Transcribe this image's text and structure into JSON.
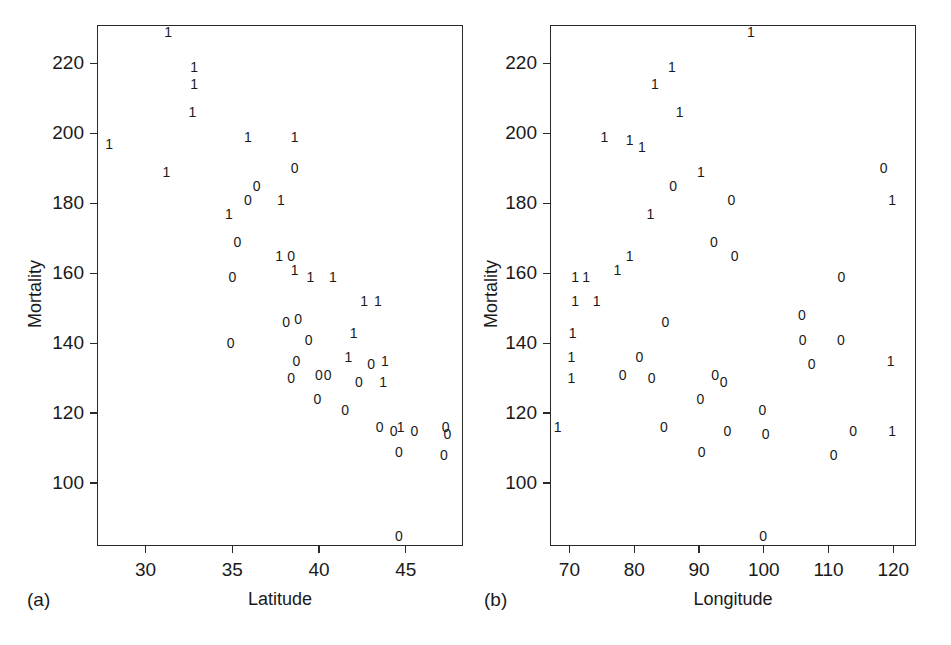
{
  "figure": {
    "background": "#ffffff",
    "ink": "#1a1a1a"
  },
  "chart_data": [
    {
      "type": "scatter",
      "panel_tag": "(a)",
      "title": "",
      "xlabel": "Latitude",
      "ylabel": "Mortality",
      "xlim": [
        27.2,
        48.3
      ],
      "ylim": [
        82,
        231
      ],
      "xticks": [
        30,
        35,
        40,
        45
      ],
      "xticklabels": [
        "30",
        "35",
        "40",
        "45"
      ],
      "yticks": [
        100,
        120,
        140,
        160,
        180,
        200,
        220
      ],
      "yticklabels": [
        "100",
        "120",
        "140",
        "160",
        "180",
        "200",
        "220"
      ],
      "grid": false,
      "legend": "none",
      "marker_encoding": "group label digit: 1 or 0",
      "groups": [
        "1",
        "0"
      ],
      "points": [
        {
          "x": 31.3,
          "y": 229,
          "label": "1"
        },
        {
          "x": 32.8,
          "y": 219,
          "label": "1"
        },
        {
          "x": 32.8,
          "y": 214,
          "label": "1"
        },
        {
          "x": 32.7,
          "y": 206,
          "label": "1"
        },
        {
          "x": 27.9,
          "y": 197,
          "label": "1"
        },
        {
          "x": 31.2,
          "y": 189,
          "label": "1"
        },
        {
          "x": 35.9,
          "y": 199,
          "label": "1"
        },
        {
          "x": 38.6,
          "y": 199,
          "label": "1"
        },
        {
          "x": 38.6,
          "y": 190,
          "label": "0"
        },
        {
          "x": 36.4,
          "y": 185,
          "label": "0"
        },
        {
          "x": 35.9,
          "y": 181,
          "label": "0"
        },
        {
          "x": 37.8,
          "y": 181,
          "label": "1"
        },
        {
          "x": 34.8,
          "y": 177,
          "label": "1"
        },
        {
          "x": 35.3,
          "y": 169,
          "label": "0"
        },
        {
          "x": 37.7,
          "y": 165,
          "label": "1"
        },
        {
          "x": 38.4,
          "y": 165,
          "label": "0"
        },
        {
          "x": 38.6,
          "y": 161,
          "label": "1"
        },
        {
          "x": 35.0,
          "y": 159,
          "label": "0"
        },
        {
          "x": 39.5,
          "y": 159,
          "label": "1"
        },
        {
          "x": 40.8,
          "y": 159,
          "label": "1"
        },
        {
          "x": 42.6,
          "y": 152,
          "label": "1"
        },
        {
          "x": 43.4,
          "y": 152,
          "label": "1"
        },
        {
          "x": 38.8,
          "y": 147,
          "label": "0"
        },
        {
          "x": 38.1,
          "y": 146,
          "label": "0"
        },
        {
          "x": 34.9,
          "y": 140,
          "label": "0"
        },
        {
          "x": 39.4,
          "y": 141,
          "label": "0"
        },
        {
          "x": 42.0,
          "y": 143,
          "label": "1"
        },
        {
          "x": 38.7,
          "y": 135,
          "label": "0"
        },
        {
          "x": 41.7,
          "y": 136,
          "label": "1"
        },
        {
          "x": 43.0,
          "y": 134,
          "label": "0"
        },
        {
          "x": 43.8,
          "y": 135,
          "label": "1"
        },
        {
          "x": 38.4,
          "y": 130,
          "label": "0"
        },
        {
          "x": 40.0,
          "y": 131,
          "label": "0"
        },
        {
          "x": 40.5,
          "y": 131,
          "label": "0"
        },
        {
          "x": 42.3,
          "y": 129,
          "label": "0"
        },
        {
          "x": 43.7,
          "y": 129,
          "label": "1"
        },
        {
          "x": 39.9,
          "y": 124,
          "label": "0"
        },
        {
          "x": 41.5,
          "y": 121,
          "label": "0"
        },
        {
          "x": 43.5,
          "y": 116,
          "label": "0"
        },
        {
          "x": 44.3,
          "y": 115,
          "label": "0"
        },
        {
          "x": 44.7,
          "y": 116,
          "label": "1"
        },
        {
          "x": 45.5,
          "y": 115,
          "label": "0"
        },
        {
          "x": 47.3,
          "y": 116,
          "label": "0"
        },
        {
          "x": 47.4,
          "y": 114,
          "label": "0"
        },
        {
          "x": 44.6,
          "y": 109,
          "label": "0"
        },
        {
          "x": 47.2,
          "y": 108,
          "label": "0"
        },
        {
          "x": 44.6,
          "y": 85,
          "label": "0"
        }
      ]
    },
    {
      "type": "scatter",
      "panel_tag": "(b)",
      "title": "",
      "xlabel": "Longitude",
      "ylabel": "Mortality",
      "xlim": [
        67.0,
        123.5
      ],
      "ylim": [
        82,
        231
      ],
      "xticks": [
        70,
        80,
        90,
        100,
        110,
        120
      ],
      "xticklabels": [
        "70",
        "80",
        "90",
        "100",
        "110",
        "120"
      ],
      "yticks": [
        100,
        120,
        140,
        160,
        180,
        200,
        220
      ],
      "yticklabels": [
        "100",
        "120",
        "140",
        "160",
        "180",
        "200",
        "220"
      ],
      "grid": false,
      "legend": "none",
      "marker_encoding": "group label digit: 1 or 0",
      "groups": [
        "1",
        "0"
      ],
      "points": [
        {
          "x": 98.0,
          "y": 229,
          "label": "1"
        },
        {
          "x": 85.8,
          "y": 219,
          "label": "1"
        },
        {
          "x": 83.2,
          "y": 214,
          "label": "1"
        },
        {
          "x": 87.0,
          "y": 206,
          "label": "1"
        },
        {
          "x": 75.4,
          "y": 199,
          "label": "1"
        },
        {
          "x": 79.3,
          "y": 198,
          "label": "1"
        },
        {
          "x": 81.2,
          "y": 196,
          "label": "1"
        },
        {
          "x": 90.3,
          "y": 189,
          "label": "1"
        },
        {
          "x": 118.5,
          "y": 190,
          "label": "0"
        },
        {
          "x": 86.0,
          "y": 185,
          "label": "0"
        },
        {
          "x": 95.0,
          "y": 181,
          "label": "0"
        },
        {
          "x": 119.8,
          "y": 181,
          "label": "1"
        },
        {
          "x": 82.5,
          "y": 177,
          "label": "1"
        },
        {
          "x": 92.3,
          "y": 169,
          "label": "0"
        },
        {
          "x": 95.5,
          "y": 165,
          "label": "0"
        },
        {
          "x": 79.3,
          "y": 165,
          "label": "1"
        },
        {
          "x": 77.4,
          "y": 161,
          "label": "1"
        },
        {
          "x": 112.0,
          "y": 159,
          "label": "0"
        },
        {
          "x": 70.9,
          "y": 159,
          "label": "1"
        },
        {
          "x": 72.6,
          "y": 159,
          "label": "1"
        },
        {
          "x": 70.9,
          "y": 152,
          "label": "1"
        },
        {
          "x": 74.2,
          "y": 152,
          "label": "1"
        },
        {
          "x": 84.8,
          "y": 146,
          "label": "0"
        },
        {
          "x": 105.9,
          "y": 148,
          "label": "0"
        },
        {
          "x": 70.5,
          "y": 143,
          "label": "1"
        },
        {
          "x": 106.0,
          "y": 141,
          "label": "0"
        },
        {
          "x": 111.9,
          "y": 141,
          "label": "0"
        },
        {
          "x": 80.8,
          "y": 136,
          "label": "0"
        },
        {
          "x": 70.3,
          "y": 136,
          "label": "1"
        },
        {
          "x": 78.2,
          "y": 131,
          "label": "0"
        },
        {
          "x": 82.7,
          "y": 130,
          "label": "0"
        },
        {
          "x": 92.5,
          "y": 131,
          "label": "0"
        },
        {
          "x": 93.8,
          "y": 129,
          "label": "0"
        },
        {
          "x": 107.4,
          "y": 134,
          "label": "0"
        },
        {
          "x": 70.3,
          "y": 130,
          "label": "1"
        },
        {
          "x": 90.2,
          "y": 124,
          "label": "0"
        },
        {
          "x": 99.8,
          "y": 121,
          "label": "0"
        },
        {
          "x": 119.6,
          "y": 135,
          "label": "1"
        },
        {
          "x": 68.2,
          "y": 116,
          "label": "1"
        },
        {
          "x": 84.6,
          "y": 116,
          "label": "0"
        },
        {
          "x": 94.4,
          "y": 115,
          "label": "0"
        },
        {
          "x": 100.3,
          "y": 114,
          "label": "0"
        },
        {
          "x": 113.8,
          "y": 115,
          "label": "0"
        },
        {
          "x": 119.8,
          "y": 115,
          "label": "1"
        },
        {
          "x": 90.4,
          "y": 109,
          "label": "0"
        },
        {
          "x": 110.8,
          "y": 108,
          "label": "0"
        },
        {
          "x": 99.9,
          "y": 85,
          "label": "0"
        }
      ]
    }
  ]
}
